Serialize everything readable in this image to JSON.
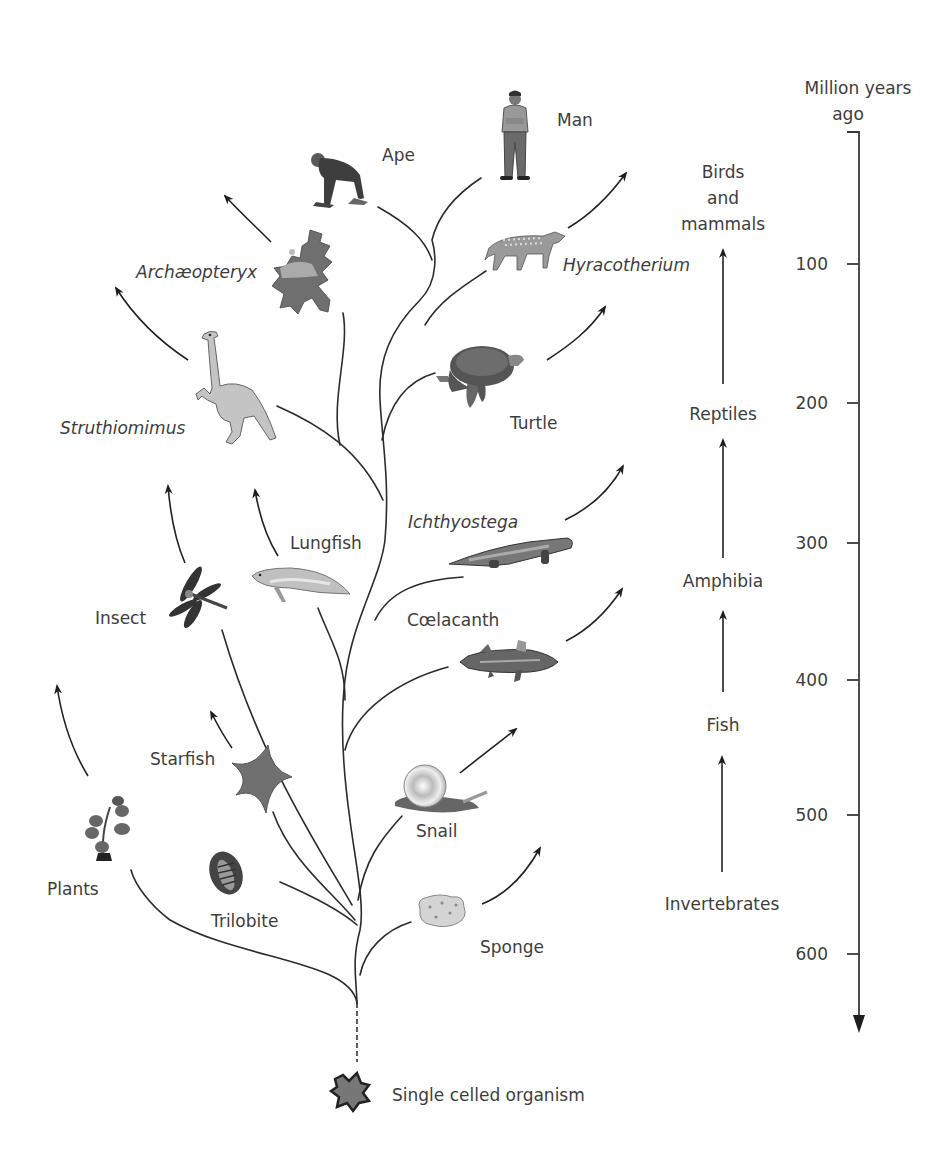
{
  "diagram": {
    "type": "evolutionary-tree",
    "root": {
      "label": "Single celled organism"
    },
    "organisms": [
      {
        "id": "man",
        "label": "Man",
        "italic": false,
        "icon": "man-icon"
      },
      {
        "id": "ape",
        "label": "Ape",
        "italic": false,
        "icon": "ape-icon"
      },
      {
        "id": "archaeopteryx",
        "label": "Archæopteryx",
        "italic": true,
        "icon": "archaeopteryx-icon"
      },
      {
        "id": "hyracotherium",
        "label": "Hyracotherium",
        "italic": true,
        "icon": "hyracotherium-icon"
      },
      {
        "id": "struthiomimus",
        "label": "Struthiomimus",
        "italic": true,
        "icon": "struthiomimus-icon"
      },
      {
        "id": "turtle",
        "label": "Turtle",
        "italic": false,
        "icon": "turtle-icon"
      },
      {
        "id": "ichthyostega",
        "label": "Ichthyostega",
        "italic": true,
        "icon": "ichthyostega-icon"
      },
      {
        "id": "lungfish",
        "label": "Lungfish",
        "italic": false,
        "icon": "lungfish-icon"
      },
      {
        "id": "insect",
        "label": "Insect",
        "italic": false,
        "icon": "dragonfly-icon"
      },
      {
        "id": "coelacanth",
        "label": "Cœlacanth",
        "italic": false,
        "icon": "coelacanth-icon"
      },
      {
        "id": "starfish",
        "label": "Starfish",
        "italic": false,
        "icon": "starfish-icon"
      },
      {
        "id": "snail",
        "label": "Snail",
        "italic": false,
        "icon": "snail-icon"
      },
      {
        "id": "plants",
        "label": "Plants",
        "italic": false,
        "icon": "plant-icon"
      },
      {
        "id": "trilobite",
        "label": "Trilobite",
        "italic": false,
        "icon": "trilobite-icon"
      },
      {
        "id": "sponge",
        "label": "Sponge",
        "italic": false,
        "icon": "sponge-icon"
      }
    ],
    "progression": {
      "stages": [
        "Invertebrates",
        "Fish",
        "Amphibia",
        "Reptiles",
        "Birds and mammals"
      ],
      "birds_lines": [
        "Birds",
        "and",
        "mammals"
      ]
    },
    "timescale": {
      "title_line1": "Million years",
      "title_line2": "ago",
      "ticks": [
        "100",
        "200",
        "300",
        "400",
        "500",
        "600"
      ]
    },
    "colors": {
      "line": "#2b2b2b",
      "text": "#3d3d3d",
      "background": "#ffffff"
    }
  }
}
